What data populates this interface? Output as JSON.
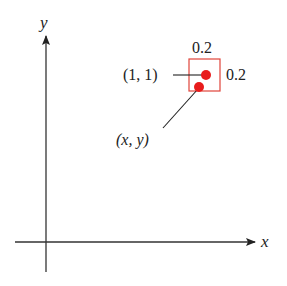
{
  "diagram": {
    "axes": {
      "x_label": "x",
      "y_label": "y",
      "color": "#333333"
    },
    "box": {
      "width_label": "0.2",
      "height_label": "0.2",
      "color": "#e0443a"
    },
    "points": [
      {
        "label": "(1, 1)",
        "color": "#e81c1c"
      },
      {
        "label": "(x, y)",
        "color": "#e81c1c"
      }
    ]
  }
}
